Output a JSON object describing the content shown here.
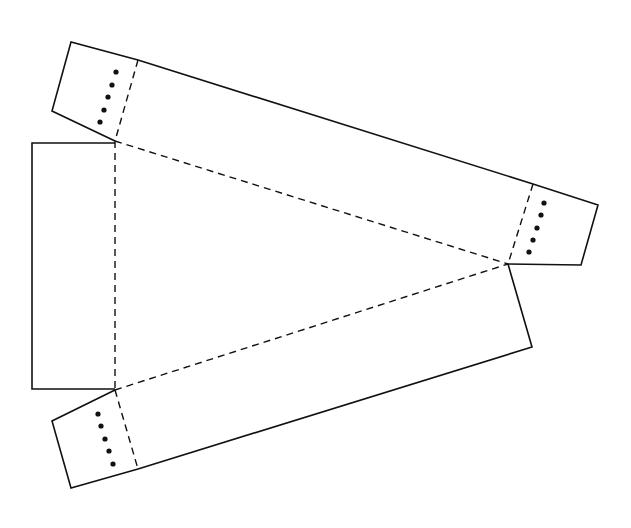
{
  "diagram": {
    "type": "paper-net",
    "colors": {
      "line": "#111111",
      "background": "#ffffff"
    },
    "cut_lines": [
      {
        "name": "top-flap-outline",
        "points": [
          [
            138,
            60
          ],
          [
            71,
            42
          ],
          [
            52,
            111
          ],
          [
            115,
            141
          ]
        ]
      },
      {
        "name": "top-panel-edge",
        "points": [
          [
            138,
            60
          ],
          [
            533,
            184
          ]
        ]
      },
      {
        "name": "right-flap-outline",
        "points": [
          [
            533,
            184
          ],
          [
            598,
            205
          ],
          [
            581,
            265
          ],
          [
            508,
            264
          ]
        ]
      },
      {
        "name": "lower-panel-edge",
        "points": [
          [
            508,
            264
          ],
          [
            532,
            347
          ],
          [
            138,
            469
          ]
        ]
      },
      {
        "name": "bottom-flap-outline",
        "points": [
          [
            138,
            469
          ],
          [
            71,
            488
          ],
          [
            52,
            421
          ],
          [
            115,
            390
          ]
        ]
      },
      {
        "name": "left-panel-outline",
        "points": [
          [
            115,
            143
          ],
          [
            32,
            143
          ],
          [
            32,
            389
          ],
          [
            115,
            389
          ]
        ]
      }
    ],
    "fold_lines": [
      {
        "name": "top-flap-fold",
        "points": [
          [
            138,
            60
          ],
          [
            115,
            141
          ]
        ]
      },
      {
        "name": "right-flap-fold",
        "points": [
          [
            533,
            184
          ],
          [
            508,
            264
          ]
        ]
      },
      {
        "name": "bottom-flap-fold",
        "points": [
          [
            115,
            390
          ],
          [
            138,
            469
          ]
        ]
      },
      {
        "name": "triangle-top-fold",
        "points": [
          [
            115,
            141
          ],
          [
            508,
            264
          ]
        ]
      },
      {
        "name": "triangle-bottom-fold",
        "points": [
          [
            115,
            390
          ],
          [
            508,
            264
          ]
        ]
      },
      {
        "name": "triangle-left-fold",
        "points": [
          [
            115,
            141
          ],
          [
            115,
            390
          ]
        ]
      }
    ],
    "glue_dots": [
      {
        "flap": "top",
        "points": [
          [
            116,
            72
          ],
          [
            112,
            85
          ],
          [
            108,
            97
          ],
          [
            104,
            110
          ],
          [
            100,
            122
          ]
        ]
      },
      {
        "flap": "right",
        "points": [
          [
            544,
            203
          ],
          [
            541,
            215
          ],
          [
            537,
            228
          ],
          [
            533,
            240
          ],
          [
            529,
            252
          ]
        ]
      },
      {
        "flap": "bottom",
        "points": [
          [
            98,
            414
          ],
          [
            101,
            426
          ],
          [
            105,
            439
          ],
          [
            109,
            451
          ],
          [
            113,
            464
          ]
        ]
      }
    ]
  }
}
